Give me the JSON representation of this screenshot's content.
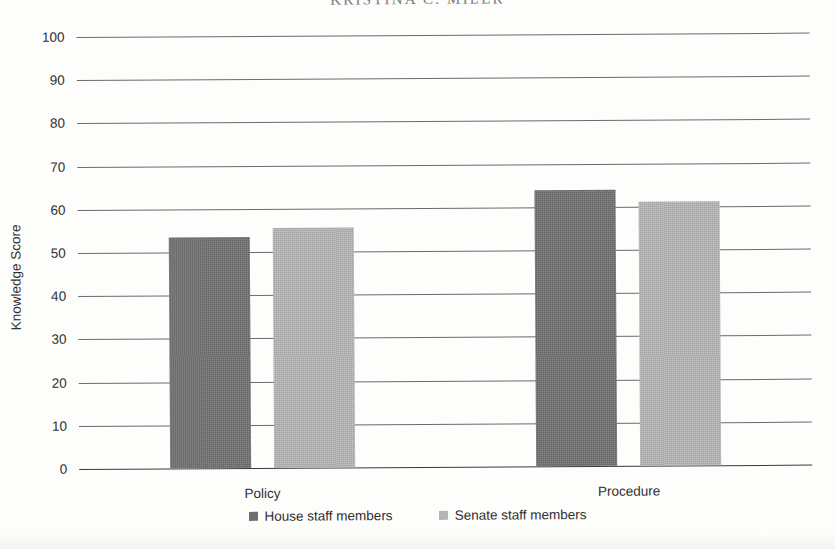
{
  "page": {
    "running_head": "KRISTINA C. MILER"
  },
  "chart_data": {
    "type": "bar",
    "title": "",
    "xlabel": "",
    "ylabel": "Knowledge Score",
    "ylim": [
      0,
      100
    ],
    "ytick_step": 10,
    "yticks": [
      100,
      90,
      80,
      70,
      60,
      50,
      40,
      30,
      20,
      10,
      0
    ],
    "grid": true,
    "legend_position": "bottom",
    "categories": [
      "Policy",
      "Procedure"
    ],
    "series": [
      {
        "name": "House staff members",
        "color": "#6e6e6e",
        "values": [
          53.5,
          64.0
        ]
      },
      {
        "name": "Senate staff members",
        "color": "#b6b6b6",
        "values": [
          55.5,
          61.0
        ]
      }
    ]
  }
}
